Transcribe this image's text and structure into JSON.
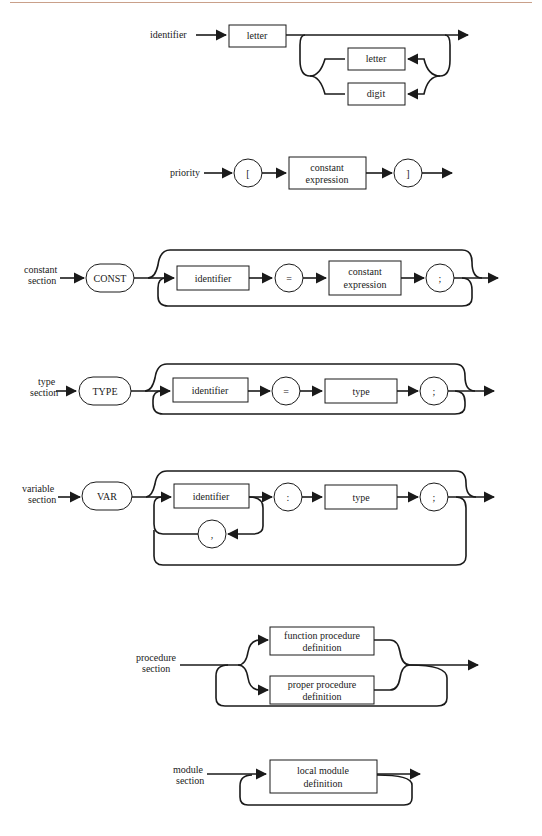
{
  "page": {
    "header_rule_color": "#c9a08a"
  },
  "diagrams": {
    "identifier": {
      "label": "identifier",
      "nodes": {
        "first": "letter",
        "loop_letter": "letter",
        "loop_digit": "digit"
      }
    },
    "priority": {
      "label": "priority",
      "nodes": {
        "open": "[",
        "expr_line1": "constant",
        "expr_line2": "expression",
        "close": "]"
      }
    },
    "constant_section": {
      "label_line1": "constant",
      "label_line2": "section",
      "nodes": {
        "keyword": "CONST",
        "identifier": "identifier",
        "equals": "=",
        "expr_line1": "constant",
        "expr_line2": "expression",
        "semicolon": ";"
      }
    },
    "type_section": {
      "label_line1": "type",
      "label_line2": "section",
      "nodes": {
        "keyword": "TYPE",
        "identifier": "identifier",
        "equals": "=",
        "type": "type",
        "semicolon": ";"
      }
    },
    "variable_section": {
      "label_line1": "variable",
      "label_line2": "section",
      "nodes": {
        "keyword": "VAR",
        "identifier": "identifier",
        "colon": ":",
        "type": "type",
        "semicolon": ";",
        "comma": ","
      }
    },
    "procedure_section": {
      "label_line1": "procedure",
      "label_line2": "section",
      "nodes": {
        "func_line1": "function procedure",
        "func_line2": "definition",
        "proper_line1": "proper procedure",
        "proper_line2": "definition"
      }
    },
    "module_section": {
      "label_line1": "module",
      "label_line2": "section",
      "nodes": {
        "local_line1": "local module",
        "local_line2": "definition"
      }
    }
  }
}
